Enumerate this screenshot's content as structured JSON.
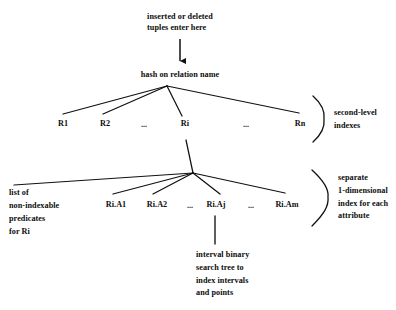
{
  "diagram": {
    "type": "tree-diagram",
    "background_color": "#ffffff",
    "line_color": "#111111",
    "text_color": "#0d0d0d",
    "nodes": {
      "entry_note": "inserted or deleted\ntuples enter here",
      "hash_node": "hash on relation name",
      "ri_node_label": "Ri"
    },
    "relation_row": [
      {
        "label": "R1",
        "x": 63
      },
      {
        "label": "R2",
        "x": 105
      },
      {
        "label": "...",
        "x": 144
      },
      {
        "label": "Ri",
        "x": 185
      },
      {
        "label": "...",
        "x": 246
      },
      {
        "label": "Rn",
        "x": 300
      }
    ],
    "attribute_row": [
      {
        "label": "Ri.A1",
        "x": 116
      },
      {
        "label": "Ri.A2",
        "x": 157
      },
      {
        "label": "...",
        "x": 190
      },
      {
        "label": "Ri.Aj",
        "x": 216
      },
      {
        "label": "...",
        "x": 251
      },
      {
        "label": "Ri.Am",
        "x": 287
      }
    ],
    "annotations": {
      "second_level": "second-level\nindexes",
      "separate_index": "separate\n1-dimensional\nindex for each\nattribute",
      "non_indexable": "list of\nnon-indexable\npredicates\nfor Ri",
      "interval_tree": "interval binary\nsearch tree to\nindex intervals\nand points"
    }
  }
}
